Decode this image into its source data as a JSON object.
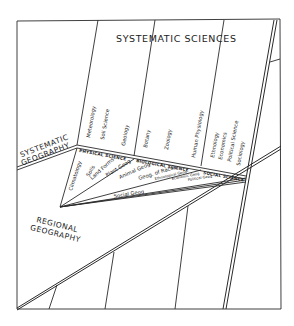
{
  "diagram": {
    "title": "SYSTEMATIC SCIENCES",
    "systematic_geography": [
      "SYSTEMATIC",
      "GEOGRAPHY"
    ],
    "regional_geography": [
      "REGIONAL",
      "GEOGRAPHY"
    ],
    "groups": {
      "physical": "PHYSICAL SCIENCE",
      "biological": "BIOLOGICAL SCIENCE",
      "social": "SOCIAL SCIENCE"
    },
    "sciences": {
      "meteorology": "Meteorology",
      "soil_science": "Soil Science",
      "geology": "Geology",
      "botany": "Botany",
      "zoology": "Zoology",
      "human_physiology": "Human Physiology",
      "ethnology": "Ethnology",
      "economics": "Economics",
      "political_science": "Political Science",
      "sociology": "Sociology"
    },
    "geographies": {
      "climatology": "Climatology",
      "soils": "Soils",
      "land_forms": "Land Forms",
      "plant_geog": "Plant Geog",
      "animal_geog": "Animal Geog",
      "geog_of_races": "Geog. of Races",
      "ethnological_geog": "Ethnological Geog",
      "economic_geog": "Economic Geog",
      "political_geog": "Political Geog",
      "social_geog": "Social Geog"
    }
  }
}
